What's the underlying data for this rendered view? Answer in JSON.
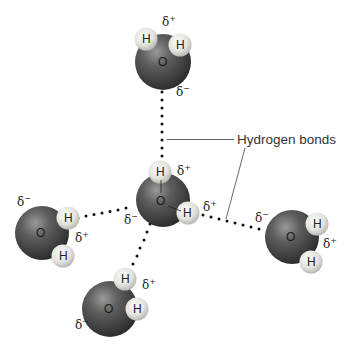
{
  "diagram": {
    "callout_label": "Hydrogen bonds",
    "atom_labels": {
      "oxygen": "O",
      "hydrogen": "H"
    },
    "charges": {
      "partial_positive": "δ+",
      "partial_negative": "δ−",
      "delta": "δ",
      "plus": "+",
      "minus": "−"
    },
    "colors": {
      "oxygen_dark": "#2e2e2e",
      "oxygen_mid": "#5a5a5a",
      "oxygen_light": "#8a8a8a",
      "hydrogen_light": "#f2f2ee",
      "hydrogen_dark": "#b9b9b2",
      "bond_dots": "#111111",
      "callout_line": "#555555"
    },
    "molecules": [
      {
        "id": "top",
        "o": [
          163,
          62
        ],
        "h": [
          [
            146,
            39
          ],
          [
            180,
            45
          ]
        ]
      },
      {
        "id": "center",
        "o": [
          163,
          200
        ],
        "h": [
          [
            160,
            172
          ],
          [
            188,
            213
          ]
        ]
      },
      {
        "id": "left",
        "o": [
          42,
          233
        ],
        "h": [
          [
            68,
            218
          ],
          [
            63,
            256
          ]
        ]
      },
      {
        "id": "right",
        "o": [
          292,
          237
        ],
        "h": [
          [
            317,
            224
          ],
          [
            311,
            262
          ]
        ]
      },
      {
        "id": "bottom",
        "o": [
          110,
          309
        ],
        "h": [
          [
            125,
            279
          ],
          [
            137,
            309
          ]
        ]
      }
    ]
  }
}
